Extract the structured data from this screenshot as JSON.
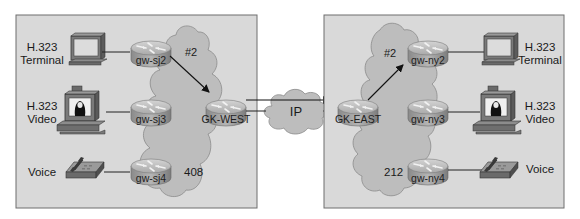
{
  "colors": {
    "background": "#ffffff",
    "zone_fill": "#d9d9d9",
    "zone_border": "#6e6e6e",
    "cloud_fill": "#bdbdbd",
    "cloud_border": "#8a8a8a",
    "router_top": "#b8b8b8",
    "router_side": "#8e8e8e",
    "link": "#222222"
  },
  "zones": {
    "west": {
      "cloud_label": "408",
      "route_label": "#2",
      "gatekeeper": "GK-WEST",
      "gateways": [
        "gw-sj2",
        "gw-sj3",
        "gw-sj4"
      ],
      "endpoints": [
        {
          "line1": "H.323",
          "line2": "Terminal",
          "type": "terminal"
        },
        {
          "line1": "H.323",
          "line2": "Video",
          "type": "video"
        },
        {
          "line1": "Voice",
          "line2": "",
          "type": "phone"
        }
      ]
    },
    "east": {
      "cloud_label": "212",
      "route_label": "#2",
      "gatekeeper": "GK-EAST",
      "gateways": [
        "gw-ny2",
        "gw-ny3",
        "gw-ny4"
      ],
      "endpoints": [
        {
          "line1": "H.323",
          "line2": "Terminal",
          "type": "terminal"
        },
        {
          "line1": "H.323",
          "line2": "Video",
          "type": "video"
        },
        {
          "line1": "Voice",
          "line2": "",
          "type": "phone"
        }
      ]
    }
  },
  "wan": {
    "label": "IP"
  }
}
